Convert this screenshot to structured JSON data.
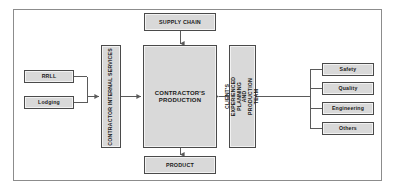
{
  "diagram": {
    "frame": {
      "border_color": "#8c8c8c"
    },
    "box_fill": "#d9d9d9",
    "box_border": "#4a4a4a",
    "connector_color": "#5a5a5a",
    "nodes": {
      "supply_chain": "SUPPLY CHAIN",
      "product": "PRODUCT",
      "production": "CONTRACTOR'S PRODUCTION",
      "internal_services": "CONTRACTOR INTERNAL SERVICES",
      "client_team": "CLIENT'S EXPERIENCED PLANNING AND PRODUCTION TEAM"
    },
    "inputs_left": [
      {
        "label": "RRLL"
      },
      {
        "label": "Lodging"
      }
    ],
    "inputs_right": [
      {
        "label": "Safety"
      },
      {
        "label": "Quality"
      },
      {
        "label": "Engineering"
      },
      {
        "label": "Others"
      }
    ],
    "connections": [
      {
        "from": "supply_chain",
        "to": "production",
        "direction": "down"
      },
      {
        "from": "production",
        "to": "product",
        "direction": "down"
      },
      {
        "from": "left-inputs",
        "to": "internal_services",
        "direction": "right"
      },
      {
        "from": "internal_services",
        "to": "production",
        "direction": "right"
      },
      {
        "from": "client_team",
        "to": "production",
        "direction": "left"
      },
      {
        "from": "right-inputs",
        "to": "client_team",
        "direction": "left"
      }
    ]
  }
}
